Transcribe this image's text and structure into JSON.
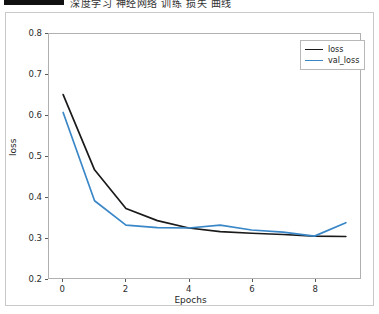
{
  "header": {
    "bar_label": "",
    "title": "深度学习 神经网络 训练 损失 曲线"
  },
  "chart_data": {
    "type": "line",
    "title": "",
    "xlabel": "Epochs",
    "ylabel": "loss",
    "x": [
      0,
      1,
      2,
      3,
      4,
      5,
      6,
      7,
      8,
      9
    ],
    "xlim": [
      -0.45,
      9.45
    ],
    "ylim": [
      0.2,
      0.8
    ],
    "xticks": [
      0,
      2,
      4,
      6,
      8
    ],
    "xtick_labels": [
      "0",
      "2",
      "4",
      "6",
      "8"
    ],
    "yticks": [
      0.2,
      0.3,
      0.4,
      0.5,
      0.6,
      0.7,
      0.8
    ],
    "ytick_labels": [
      "0.2",
      "0.3",
      "0.4",
      "0.5",
      "0.6",
      "0.7",
      "0.8"
    ],
    "grid": false,
    "legend_position": "upper right",
    "series": [
      {
        "name": "loss",
        "color": "#1a1a1a",
        "values": [
          0.651,
          0.466,
          0.371,
          0.341,
          0.323,
          0.314,
          0.31,
          0.307,
          0.303,
          0.302
        ]
      },
      {
        "name": "val_loss",
        "color": "#3a87c8",
        "values": [
          0.607,
          0.39,
          0.33,
          0.324,
          0.323,
          0.33,
          0.318,
          0.313,
          0.303,
          0.336
        ]
      }
    ]
  }
}
